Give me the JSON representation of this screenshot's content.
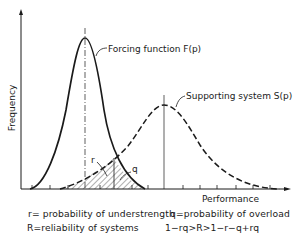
{
  "figure": {
    "y_axis_label": "Frequency",
    "x_axis_label": "Performance",
    "curves": [
      {
        "id": "F",
        "label": "Forcing function F(p)",
        "style": "solid",
        "peak_x": 85,
        "peak_y": 38
      },
      {
        "id": "S",
        "label": "Supporting system S(p)",
        "style": "dashed",
        "peak_x": 164,
        "peak_y": 105
      }
    ],
    "region_labels": {
      "r": "r",
      "q": "q"
    },
    "legend": {
      "r_def": "r= probability of understrength",
      "q_def": "q=probability of overload",
      "R_def": "R=reliability of systems",
      "inequality": "1−rq>R>1−r−q+rq"
    },
    "colors": {
      "ink": "#1a1a1a",
      "background": "#ffffff"
    }
  }
}
